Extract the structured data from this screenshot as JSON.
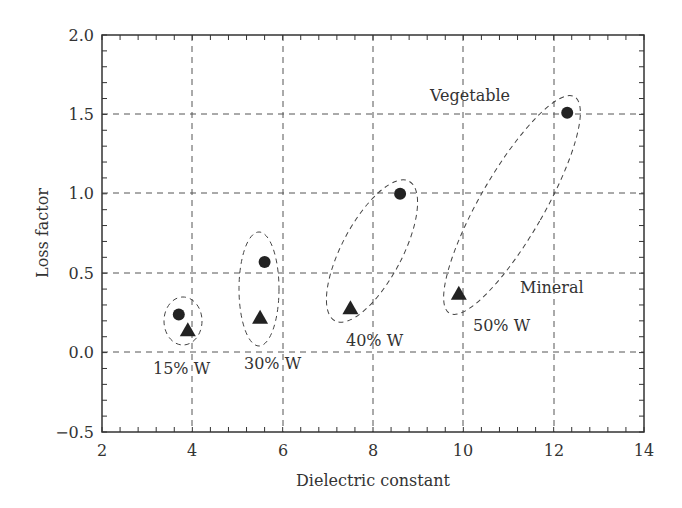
{
  "chart_data": {
    "type": "scatter",
    "title": "",
    "xlabel": "Dielectric constant",
    "ylabel": "Loss factor",
    "xlim": [
      2,
      14
    ],
    "ylim": [
      -0.5,
      2.0
    ],
    "xticks": [
      "2",
      "4",
      "6",
      "8",
      "10",
      "12",
      "14"
    ],
    "yticks": [
      "−0.5",
      "0.0",
      "0.5",
      "1.0",
      "1.5",
      "2.0"
    ],
    "grid": true,
    "series": [
      {
        "name": "Vegetable",
        "marker": "circle",
        "points": [
          {
            "x": 3.7,
            "y": 0.24
          },
          {
            "x": 5.6,
            "y": 0.57
          },
          {
            "x": 8.6,
            "y": 1.0
          },
          {
            "x": 12.3,
            "y": 1.51
          }
        ]
      },
      {
        "name": "Mineral",
        "marker": "triangle",
        "points": [
          {
            "x": 3.9,
            "y": 0.14
          },
          {
            "x": 5.5,
            "y": 0.22
          },
          {
            "x": 7.5,
            "y": 0.28
          },
          {
            "x": 9.9,
            "y": 0.37
          }
        ]
      }
    ],
    "groups": [
      {
        "label": "15% W"
      },
      {
        "label": "30% W"
      },
      {
        "label": "40% W"
      },
      {
        "label": "50% W"
      }
    ],
    "annotations": {
      "vegetable": "Vegetable",
      "mineral": "Mineral"
    }
  }
}
